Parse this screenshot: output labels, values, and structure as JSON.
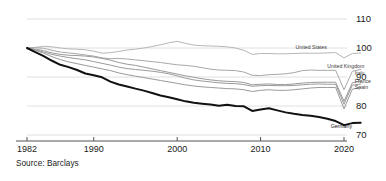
{
  "source_note": "Source: Barclays",
  "chart_data": {
    "type": "line",
    "title": "",
    "subtitle": "",
    "xlabel": "",
    "ylabel": "",
    "xlim": [
      1982,
      2023
    ],
    "ylim": [
      66,
      113
    ],
    "grid": true,
    "grid_axis": "y",
    "legend_position": "inline-right-end-labels",
    "y_ticks": [
      110,
      100,
      90,
      80,
      70
    ],
    "y_tick_labels": [
      "110",
      "100",
      "90",
      "80",
      "70"
    ],
    "x_ticks": [
      1982,
      1990,
      2000,
      2010,
      2020
    ],
    "x_tick_labels": [
      "1982",
      "1990",
      "2000",
      "2010",
      "2020"
    ],
    "x": [
      1982,
      1983,
      1984,
      1985,
      1986,
      1987,
      1988,
      1989,
      1990,
      1991,
      1992,
      1993,
      1994,
      1995,
      1996,
      1997,
      1998,
      1999,
      2000,
      2001,
      2002,
      2003,
      2004,
      2005,
      2006,
      2007,
      2008,
      2009,
      2010,
      2011,
      2012,
      2013,
      2014,
      2015,
      2016,
      2017,
      2018,
      2019,
      2020,
      2021,
      2022
    ],
    "series": [
      {
        "name": "United States",
        "label": "United States",
        "color": "#b6b6b6",
        "width": 1.0,
        "label_x": 2014.2,
        "label_y": 99.6,
        "values": [
          100.0,
          100.2,
          100.6,
          100.4,
          100.0,
          99.7,
          99.6,
          99.4,
          98.9,
          98.2,
          98.4,
          98.8,
          99.3,
          99.6,
          100.0,
          100.5,
          101.1,
          101.8,
          102.3,
          101.6,
          101.0,
          100.8,
          100.7,
          100.6,
          100.4,
          100.0,
          99.2,
          97.8,
          98.1,
          98.1,
          98.0,
          98.0,
          98.1,
          98.2,
          98.2,
          98.2,
          98.3,
          98.4,
          96.6,
          98.1,
          98.3
        ]
      },
      {
        "name": "United Kingdom",
        "label": "United Kingdom",
        "color": "#a8a8a8",
        "width": 1.0,
        "label_x": 2018.0,
        "label_y": 93.0,
        "values": [
          100.0,
          100.1,
          99.9,
          99.2,
          98.6,
          98.3,
          98.0,
          97.6,
          97.2,
          96.6,
          96.3,
          96.4,
          96.2,
          95.9,
          95.6,
          95.3,
          95.0,
          94.6,
          94.2,
          94.0,
          93.7,
          93.2,
          92.7,
          92.4,
          92.3,
          92.2,
          91.7,
          90.6,
          90.5,
          90.8,
          90.9,
          91.1,
          91.5,
          92.2,
          92.4,
          92.3,
          92.3,
          92.3,
          85.6,
          92.0,
          92.6
        ]
      },
      {
        "name": "Italy",
        "label": "Italy",
        "color": "#9a9a9a",
        "width": 1.0,
        "label_x": 2021.3,
        "label_y": 90.6,
        "values": [
          100.0,
          99.6,
          99.1,
          98.3,
          97.8,
          97.5,
          97.4,
          97.2,
          96.9,
          96.4,
          95.8,
          95.0,
          94.4,
          94.0,
          93.4,
          92.8,
          92.2,
          91.6,
          91.0,
          90.4,
          89.9,
          89.4,
          89.0,
          88.7,
          88.5,
          88.4,
          88.1,
          87.3,
          87.5,
          87.6,
          87.4,
          87.4,
          87.6,
          87.9,
          88.1,
          88.2,
          88.2,
          88.2,
          81.6,
          88.0,
          88.6
        ]
      },
      {
        "name": "France",
        "label": "France",
        "color": "#9a9a9a",
        "width": 1.0,
        "label_x": 2021.3,
        "label_y": 88.0,
        "values": [
          100.0,
          99.4,
          98.6,
          97.8,
          97.2,
          96.7,
          96.3,
          95.9,
          95.3,
          94.7,
          94.1,
          93.4,
          92.9,
          92.6,
          92.3,
          92.0,
          91.6,
          91.1,
          90.4,
          89.6,
          89.0,
          88.6,
          88.3,
          88.0,
          87.8,
          87.7,
          87.4,
          86.8,
          87.0,
          87.1,
          87.0,
          87.0,
          87.1,
          87.3,
          87.5,
          87.6,
          87.5,
          87.5,
          80.6,
          87.2,
          87.6
        ]
      },
      {
        "name": "Spain",
        "label": "Spain",
        "color": "#9a9a9a",
        "width": 1.0,
        "label_x": 2021.3,
        "label_y": 85.8,
        "values": [
          100.0,
          99.2,
          98.2,
          97.0,
          96.0,
          95.2,
          94.6,
          94.0,
          93.4,
          92.8,
          92.2,
          91.4,
          90.8,
          90.3,
          89.8,
          89.3,
          88.8,
          88.3,
          87.8,
          87.3,
          86.9,
          86.6,
          86.4,
          86.2,
          86.0,
          85.9,
          85.6,
          85.0,
          85.4,
          85.6,
          85.4,
          85.4,
          85.6,
          85.9,
          86.2,
          86.4,
          86.4,
          86.4,
          79.0,
          85.8,
          86.4
        ]
      },
      {
        "name": "Germany",
        "label": "Germany",
        "color": "#111111",
        "width": 2.0,
        "label_x": 2018.4,
        "label_y": 72.3,
        "values": [
          100.0,
          98.6,
          97.2,
          95.6,
          94.2,
          93.4,
          92.4,
          91.2,
          90.6,
          89.9,
          88.4,
          87.4,
          86.7,
          86.0,
          85.3,
          84.5,
          83.6,
          83.0,
          82.3,
          81.6,
          81.1,
          80.8,
          80.5,
          80.1,
          80.4,
          80.0,
          79.9,
          78.3,
          78.8,
          79.2,
          78.5,
          77.8,
          77.3,
          76.9,
          76.6,
          76.2,
          75.6,
          74.8,
          73.4,
          74.1,
          74.2
        ]
      }
    ]
  }
}
